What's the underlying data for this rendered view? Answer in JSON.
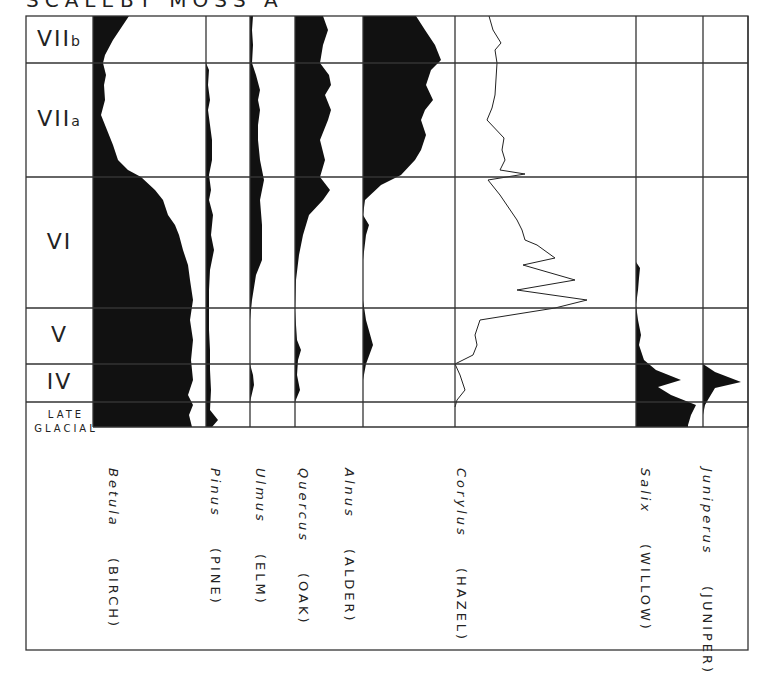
{
  "title": "SCALEBY MOSS A",
  "chart_data": {
    "type": "area",
    "title": "SCALEBY MOSS A",
    "zones": [
      {
        "label": "VIIb",
        "y_top": 16,
        "y_bottom": 63
      },
      {
        "label": "VIIa",
        "y_top": 63,
        "y_bottom": 177
      },
      {
        "label": "VI",
        "y_top": 177,
        "y_bottom": 308
      },
      {
        "label": "V",
        "y_top": 308,
        "y_bottom": 364
      },
      {
        "label": "IV",
        "y_top": 364,
        "y_bottom": 402
      },
      {
        "label": "LATE GLACIAL",
        "y_top": 402,
        "y_bottom": 427
      }
    ],
    "series": [
      {
        "name": "Betula",
        "common": "BIRCH",
        "style": "silhouette",
        "x0": 93,
        "x1": 205,
        "points": [
          [
            16,
            36
          ],
          [
            25,
            30
          ],
          [
            40,
            20
          ],
          [
            55,
            12
          ],
          [
            63,
            10
          ],
          [
            75,
            13
          ],
          [
            85,
            11
          ],
          [
            100,
            12
          ],
          [
            115,
            8
          ],
          [
            130,
            14
          ],
          [
            145,
            20
          ],
          [
            160,
            25
          ],
          [
            170,
            35
          ],
          [
            177,
            48
          ],
          [
            190,
            62
          ],
          [
            200,
            70
          ],
          [
            215,
            75
          ],
          [
            225,
            82
          ],
          [
            235,
            86
          ],
          [
            250,
            90
          ],
          [
            265,
            95
          ],
          [
            280,
            97
          ],
          [
            300,
            100
          ],
          [
            320,
            97
          ],
          [
            340,
            100
          ],
          [
            360,
            98
          ],
          [
            380,
            100
          ],
          [
            395,
            95
          ],
          [
            405,
            100
          ],
          [
            415,
            96
          ],
          [
            427,
            99
          ]
        ]
      },
      {
        "name": "Pinus",
        "common": "PINE",
        "style": "silhouette",
        "x0": 206,
        "x1": 250,
        "points": [
          [
            16,
            0
          ],
          [
            63,
            0
          ],
          [
            70,
            3
          ],
          [
            85,
            2
          ],
          [
            100,
            4
          ],
          [
            110,
            2
          ],
          [
            125,
            4
          ],
          [
            140,
            6
          ],
          [
            160,
            6
          ],
          [
            175,
            3
          ],
          [
            190,
            5
          ],
          [
            200,
            3
          ],
          [
            215,
            7
          ],
          [
            235,
            5
          ],
          [
            250,
            8
          ],
          [
            270,
            4
          ],
          [
            290,
            3
          ],
          [
            310,
            3
          ],
          [
            330,
            3
          ],
          [
            350,
            4
          ],
          [
            370,
            4
          ],
          [
            390,
            5
          ],
          [
            410,
            4
          ],
          [
            420,
            12
          ],
          [
            427,
            6
          ]
        ]
      },
      {
        "name": "Ulmus",
        "common": "ELM",
        "style": "silhouette",
        "x0": 250,
        "x1": 295,
        "points": [
          [
            16,
            3
          ],
          [
            30,
            2
          ],
          [
            45,
            3
          ],
          [
            63,
            2
          ],
          [
            75,
            6
          ],
          [
            90,
            10
          ],
          [
            100,
            8
          ],
          [
            110,
            10
          ],
          [
            125,
            8
          ],
          [
            140,
            8
          ],
          [
            160,
            10
          ],
          [
            180,
            14
          ],
          [
            200,
            10
          ],
          [
            225,
            12
          ],
          [
            240,
            12
          ],
          [
            260,
            12
          ],
          [
            275,
            6
          ],
          [
            300,
            2
          ],
          [
            320,
            0
          ],
          [
            364,
            0
          ],
          [
            375,
            3
          ],
          [
            385,
            4
          ],
          [
            402,
            0
          ],
          [
            427,
            0
          ]
        ]
      },
      {
        "name": "Quercus",
        "common": "OAK",
        "style": "silhouette",
        "x0": 295,
        "x1": 363,
        "points": [
          [
            16,
            28
          ],
          [
            30,
            33
          ],
          [
            45,
            28
          ],
          [
            63,
            25
          ],
          [
            75,
            34
          ],
          [
            85,
            36
          ],
          [
            95,
            30
          ],
          [
            110,
            36
          ],
          [
            120,
            33
          ],
          [
            140,
            25
          ],
          [
            160,
            30
          ],
          [
            177,
            25
          ],
          [
            190,
            35
          ],
          [
            200,
            28
          ],
          [
            215,
            14
          ],
          [
            235,
            8
          ],
          [
            255,
            4
          ],
          [
            280,
            1
          ],
          [
            310,
            0
          ],
          [
            340,
            2
          ],
          [
            350,
            6
          ],
          [
            360,
            3
          ],
          [
            375,
            2
          ],
          [
            390,
            5
          ],
          [
            402,
            0
          ],
          [
            427,
            0
          ]
        ]
      },
      {
        "name": "Alnus",
        "common": "ALDER",
        "style": "silhouette",
        "x0": 363,
        "x1": 455,
        "points": [
          [
            16,
            53
          ],
          [
            30,
            62
          ],
          [
            45,
            72
          ],
          [
            60,
            78
          ],
          [
            63,
            75
          ],
          [
            70,
            68
          ],
          [
            85,
            63
          ],
          [
            100,
            70
          ],
          [
            110,
            62
          ],
          [
            120,
            58
          ],
          [
            135,
            63
          ],
          [
            150,
            58
          ],
          [
            160,
            52
          ],
          [
            175,
            38
          ],
          [
            185,
            18
          ],
          [
            200,
            2
          ],
          [
            215,
            0
          ],
          [
            225,
            6
          ],
          [
            235,
            3
          ],
          [
            260,
            0
          ],
          [
            300,
            0
          ],
          [
            320,
            3
          ],
          [
            345,
            10
          ],
          [
            364,
            3
          ],
          [
            380,
            0
          ],
          [
            427,
            0
          ]
        ]
      },
      {
        "name": "Corylus",
        "common": "HAZEL",
        "style": "line",
        "x0": 455,
        "x1": 636,
        "points": [
          [
            16,
            34
          ],
          [
            30,
            38
          ],
          [
            43,
            46
          ],
          [
            50,
            40
          ],
          [
            63,
            42
          ],
          [
            95,
            40
          ],
          [
            108,
            37
          ],
          [
            120,
            32
          ],
          [
            138,
            49
          ],
          [
            150,
            47
          ],
          [
            160,
            50
          ],
          [
            170,
            45
          ],
          [
            174,
            70
          ],
          [
            180,
            33
          ],
          [
            195,
            45
          ],
          [
            220,
            62
          ],
          [
            230,
            67
          ],
          [
            240,
            70
          ],
          [
            245,
            82
          ],
          [
            258,
            100
          ],
          [
            265,
            68
          ],
          [
            280,
            120
          ],
          [
            290,
            62
          ],
          [
            300,
            132
          ],
          [
            308,
            100
          ],
          [
            320,
            25
          ],
          [
            335,
            20
          ],
          [
            345,
            22
          ],
          [
            355,
            18
          ],
          [
            364,
            0
          ],
          [
            375,
            5
          ],
          [
            390,
            10
          ],
          [
            400,
            2
          ],
          [
            407,
            0
          ]
        ]
      },
      {
        "name": "Salix",
        "common": "WILLOW",
        "style": "silhouette",
        "x0": 636,
        "x1": 703,
        "points": [
          [
            16,
            0
          ],
          [
            262,
            0
          ],
          [
            268,
            4
          ],
          [
            278,
            3
          ],
          [
            290,
            2
          ],
          [
            305,
            0
          ],
          [
            320,
            2
          ],
          [
            335,
            5
          ],
          [
            345,
            3
          ],
          [
            360,
            8
          ],
          [
            370,
            20
          ],
          [
            380,
            45
          ],
          [
            387,
            22
          ],
          [
            395,
            35
          ],
          [
            405,
            60
          ],
          [
            415,
            55
          ],
          [
            425,
            52
          ],
          [
            427,
            52
          ]
        ]
      },
      {
        "name": "Juniperus",
        "common": "JUNIPER",
        "style": "silhouette",
        "x0": 703,
        "x1": 748,
        "points": [
          [
            16,
            0
          ],
          [
            364,
            0
          ],
          [
            372,
            12
          ],
          [
            382,
            38
          ],
          [
            388,
            12
          ],
          [
            398,
            6
          ],
          [
            405,
            2
          ],
          [
            415,
            0
          ],
          [
            427,
            0
          ]
        ]
      }
    ],
    "xlabel": "",
    "ylabel": "",
    "grid": true
  },
  "taxa_labels": [
    {
      "latin": "Betula",
      "common": "(BIRCH)",
      "x": 106
    },
    {
      "latin": "Pinus",
      "common": "(PINE)",
      "x": 208
    },
    {
      "latin": "Ulmus",
      "common": "(ELM)",
      "x": 253
    },
    {
      "latin": "Quercus",
      "common": "(OAK)",
      "x": 296
    },
    {
      "latin": "Alnus",
      "common": "(ALDER)",
      "x": 342
    },
    {
      "latin": "Corylus",
      "common": "(HAZEL)",
      "x": 454
    },
    {
      "latin": "Salix",
      "common": "(WILLOW)",
      "x": 638
    },
    {
      "latin": "Juniperus",
      "common": "(JUNIPER)",
      "x": 700
    }
  ],
  "zone_labels": [
    "VIIb",
    "VIIa",
    "VI",
    "V",
    "IV",
    "LATE",
    "GLACIAL"
  ]
}
